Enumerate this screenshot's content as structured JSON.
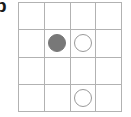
{
  "figure": {
    "label": "b",
    "label_cropped": true
  },
  "board": {
    "rows": 4,
    "columns": 4,
    "grid_line_color": "#b2b2b2",
    "background_color": "#ffffff",
    "filled_marker_color": "#787878",
    "open_marker_outline_color": "#9a9a9a",
    "cells": [
      [
        {
          "row": 1,
          "column": 1,
          "marker": "empty"
        },
        {
          "row": 1,
          "column": 2,
          "marker": "empty"
        },
        {
          "row": 1,
          "column": 3,
          "marker": "empty"
        },
        {
          "row": 1,
          "column": 4,
          "marker": "empty"
        }
      ],
      [
        {
          "row": 2,
          "column": 1,
          "marker": "empty"
        },
        {
          "row": 2,
          "column": 2,
          "marker": "filled"
        },
        {
          "row": 2,
          "column": 3,
          "marker": "open"
        },
        {
          "row": 2,
          "column": 4,
          "marker": "empty"
        }
      ],
      [
        {
          "row": 3,
          "column": 1,
          "marker": "empty"
        },
        {
          "row": 3,
          "column": 2,
          "marker": "empty"
        },
        {
          "row": 3,
          "column": 3,
          "marker": "empty"
        },
        {
          "row": 3,
          "column": 4,
          "marker": "empty"
        }
      ],
      [
        {
          "row": 4,
          "column": 1,
          "marker": "empty"
        },
        {
          "row": 4,
          "column": 2,
          "marker": "empty"
        },
        {
          "row": 4,
          "column": 3,
          "marker": "open"
        },
        {
          "row": 4,
          "column": 4,
          "marker": "empty"
        }
      ]
    ]
  }
}
